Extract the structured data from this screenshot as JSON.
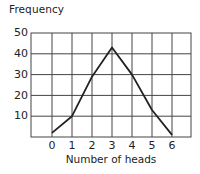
{
  "chart_data": {
    "type": "line",
    "title": "",
    "ylabel": "Frequency",
    "xlabel": "Number of heads",
    "x": [
      0,
      1,
      2,
      3,
      4,
      5,
      6
    ],
    "categories": [
      "0",
      "1",
      "2",
      "3",
      "4",
      "5",
      "6"
    ],
    "series": [
      {
        "name": "Frequency",
        "values": [
          2,
          10,
          29,
          43,
          30,
          13,
          1
        ]
      }
    ],
    "xlim": [
      -1,
      7
    ],
    "ylim": [
      0,
      50
    ],
    "yticks": [
      "10",
      "20",
      "30",
      "40",
      "50"
    ],
    "grid": true,
    "legend": "none"
  },
  "colors": {
    "line": "#222222",
    "grid": "#444444",
    "background": "#ffffff"
  }
}
